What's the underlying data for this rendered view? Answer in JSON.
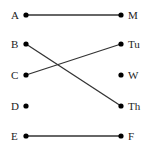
{
  "diagram": {
    "left_nodes": [
      {
        "label": "A",
        "y": 15
      },
      {
        "label": "B",
        "y": 44
      },
      {
        "label": "C",
        "y": 75
      },
      {
        "label": "D",
        "y": 106
      },
      {
        "label": "E",
        "y": 136
      }
    ],
    "right_nodes": [
      {
        "label": "M",
        "y": 15
      },
      {
        "label": "Tu",
        "y": 44
      },
      {
        "label": "W",
        "y": 75
      },
      {
        "label": "Th",
        "y": 106
      },
      {
        "label": "F",
        "y": 136
      }
    ],
    "edges": [
      {
        "from": "A",
        "to": "M"
      },
      {
        "from": "B",
        "to": "Th"
      },
      {
        "from": "C",
        "to": "Tu"
      },
      {
        "from": "E",
        "to": "F"
      }
    ],
    "line_color": "#333333",
    "dot_color": "#000000"
  }
}
